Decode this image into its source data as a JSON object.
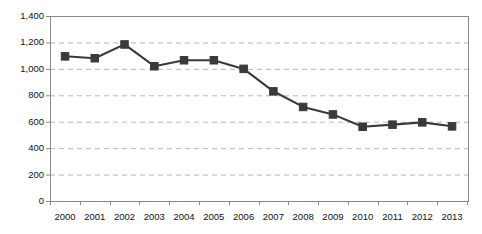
{
  "chart_data": {
    "type": "line",
    "title": "",
    "xlabel": "",
    "ylabel": "Deaths",
    "categories": [
      "2000",
      "2001",
      "2002",
      "2003",
      "2004",
      "2005",
      "2006",
      "2007",
      "2008",
      "2009",
      "2010",
      "2011",
      "2012",
      "2013"
    ],
    "values": [
      1095,
      1080,
      1185,
      1020,
      1065,
      1065,
      1000,
      830,
      712,
      655,
      562,
      578,
      595,
      565
    ],
    "series": [
      {
        "name": "Deaths",
        "values": [
          1095,
          1080,
          1185,
          1020,
          1065,
          1065,
          1000,
          830,
          712,
          655,
          562,
          578,
          595,
          565
        ]
      }
    ],
    "ylim": [
      0,
      1400
    ],
    "ytick_values": [
      0,
      200,
      400,
      600,
      800,
      1000,
      1200,
      1400
    ],
    "ytick_labels": [
      "0",
      "200",
      "400",
      "600",
      "800",
      "1,000",
      "1,200",
      "1,400"
    ],
    "grid": "horizontal-dashed",
    "legend": "none",
    "marker": "square",
    "line_color": "#3a3a3a",
    "marker_color": "#3a3a3a",
    "grid_color": "#b8b8b8",
    "axis_color": "#8a8a8a",
    "background_color": "#ffffff"
  }
}
